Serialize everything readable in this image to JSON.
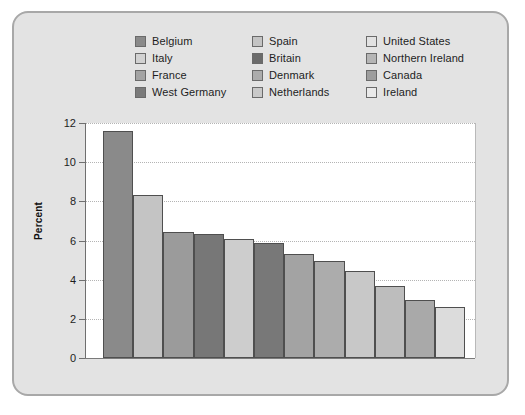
{
  "chart_data": {
    "type": "bar",
    "title": "",
    "xlabel": "",
    "ylabel": "Percent",
    "ylim": [
      0,
      12
    ],
    "yticks": [
      0,
      2,
      4,
      6,
      8,
      10,
      12
    ],
    "grid": "horizontal-dotted",
    "legend_position": "top",
    "categories": [
      "Belgium",
      "Spain",
      "United States",
      "Italy",
      "Britain",
      "Northern Ireland",
      "France",
      "Denmark",
      "Canada",
      "West Germany",
      "Netherlands",
      "Ireland"
    ],
    "values": [
      11.6,
      8.3,
      6.45,
      6.35,
      6.1,
      5.85,
      5.3,
      4.95,
      4.45,
      3.7,
      2.95,
      2.6
    ],
    "bar_colors": [
      "#8a8a8a",
      "#c4c4c4",
      "#9b9b9b",
      "#777777",
      "#cdcdcd",
      "#787878",
      "#a3a3a3",
      "#acacac",
      "#c8c8c8",
      "#bdbdbd",
      "#a9a9a9",
      "#dcdcdc"
    ]
  },
  "legend": {
    "columns": [
      {
        "items": [
          {
            "label": "Belgium",
            "color": "#8a8a8a"
          },
          {
            "label": "Italy",
            "color": "#d2d2d2"
          },
          {
            "label": "France",
            "color": "#a3a3a3"
          },
          {
            "label": "West Germany",
            "color": "#7a7a7a"
          }
        ]
      },
      {
        "items": [
          {
            "label": "Spain",
            "color": "#c4c4c4"
          },
          {
            "label": "Britain",
            "color": "#6b6b6b"
          },
          {
            "label": "Denmark",
            "color": "#acacac"
          },
          {
            "label": "Netherlands",
            "color": "#c9c9c9"
          }
        ]
      },
      {
        "items": [
          {
            "label": "United States",
            "color": "#e2e2e2"
          },
          {
            "label": "Northern Ireland",
            "color": "#b5b5b5"
          },
          {
            "label": "Canada",
            "color": "#9d9d9d"
          },
          {
            "label": "Ireland",
            "color": "#eaeaea"
          }
        ]
      }
    ]
  },
  "colors": {
    "frame_background": "#e3e3e3",
    "frame_border": "#a8a8a8",
    "plot_background": "#ffffff",
    "gridline": "#b4b4b4",
    "axis": "#6f6f6f",
    "text": "#1d1d1d"
  }
}
